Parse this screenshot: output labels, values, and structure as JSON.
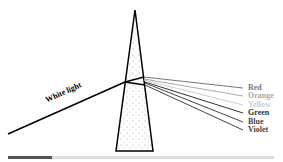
{
  "diagram": {
    "input_label": "White light",
    "spectrum": [
      {
        "label": "Red",
        "color": "#777777",
        "y": 87
      },
      {
        "label": "Orange",
        "color": "#aaaaaa",
        "y": 95
      },
      {
        "label": "Yellow",
        "color": "#cccccc",
        "y": 104
      },
      {
        "label": "Green",
        "color": "#333333",
        "y": 112
      },
      {
        "label": "Blue",
        "color": "#444444",
        "y": 121
      },
      {
        "label": "Violet",
        "color": "#444444",
        "y": 129
      }
    ]
  },
  "progress": {
    "value_px": 44,
    "track_color": "#dddddd",
    "fill_color": "#555555"
  }
}
